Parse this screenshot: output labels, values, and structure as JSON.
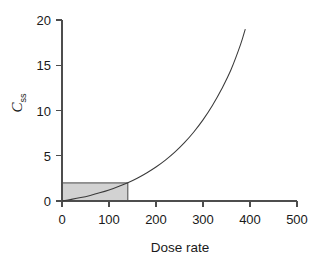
{
  "chart_data": {
    "type": "line",
    "title": "",
    "subtitle": "",
    "xlabel": "Dose rate",
    "ylabel": "C_ss",
    "ylabel_base": "C",
    "ylabel_sub": "ss",
    "xlim": [
      0,
      500
    ],
    "ylim": [
      0,
      20
    ],
    "xticks": [
      0,
      100,
      200,
      300,
      400,
      500
    ],
    "yticks": [
      0,
      5,
      10,
      15,
      20
    ],
    "xtick_labels": [
      "0",
      "100",
      "200",
      "300",
      "400",
      "500"
    ],
    "ytick_labels": [
      "0",
      "5",
      "10",
      "15",
      "20"
    ],
    "grid": false,
    "legend": null,
    "legend_position": "none",
    "series": [
      {
        "name": "steady-state concentration",
        "description": "Non-linear (saturable) dose rate to steady-state concentration relationship",
        "x": [
          0,
          20,
          40,
          60,
          80,
          100,
          120,
          140,
          160,
          180,
          200,
          220,
          240,
          260,
          280,
          300,
          320,
          340,
          360,
          380,
          390
        ],
        "y": [
          0.0,
          0.18,
          0.38,
          0.62,
          0.9,
          1.22,
          1.6,
          2.02,
          2.52,
          3.1,
          3.76,
          4.52,
          5.4,
          6.42,
          7.6,
          8.96,
          10.55,
          12.4,
          14.55,
          17.3,
          19.0
        ]
      }
    ],
    "annotations": [
      {
        "type": "rectangle",
        "name": "linear-region-shading",
        "x0": 0,
        "x1": 140,
        "y0": 0,
        "y1": 2,
        "fill": "#d2d2d2",
        "stroke": "#555555"
      }
    ],
    "colors": {
      "curve": "#3a3a3a",
      "axis": "#4d4d4d",
      "shade_fill": "#d2d2d2",
      "shade_stroke": "#555555",
      "text": "#1a1a1a",
      "background": "#ffffff"
    }
  }
}
